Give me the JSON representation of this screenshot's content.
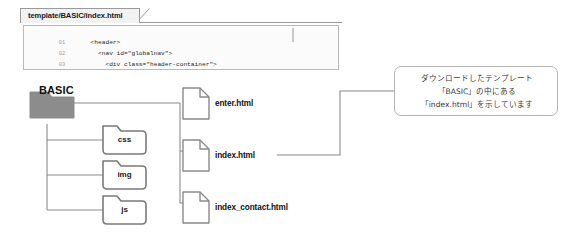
{
  "code_panel": {
    "tab_label": "template/BASIC/index.html",
    "lines": [
      {
        "num": "01",
        "text": "    <header>"
      },
      {
        "num": "02",
        "text": "      <nav id=\"globalnav\">"
      },
      {
        "num": "03",
        "text": "        <div class=\"header-container\">"
      },
      {
        "num": "04",
        "text": "          <h1 class=\"logo\"><a href=\"index.html\">SITE NAME</a></h1>"
      }
    ]
  },
  "diagram": {
    "root_label": "BASIC",
    "folders": [
      {
        "label": "css"
      },
      {
        "label": "img"
      },
      {
        "label": "js"
      }
    ],
    "files": [
      {
        "label": "enter.html"
      },
      {
        "label": "index.html"
      },
      {
        "label": "index_contact.html"
      }
    ]
  },
  "callout": {
    "lines": [
      "ダウンロードしたテンプレート",
      "「BASIC」の中にある",
      "「index.html」を示しています"
    ]
  },
  "colors": {
    "root_folder_fill": "#8c8c8c",
    "folder_stroke": "#7a7a7a",
    "line": "#8a8a8a",
    "panel_border": "#9a9a9a",
    "callout_border": "#b4b4b4"
  }
}
